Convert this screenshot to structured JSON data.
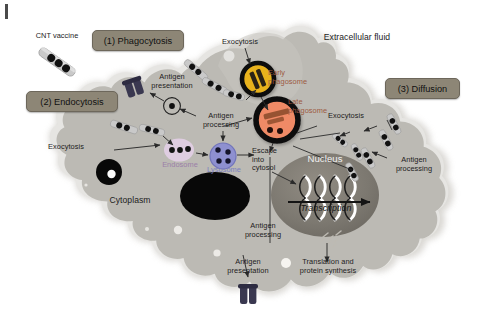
{
  "figure": {
    "domain_kind": "biology-schematic",
    "background_color": "#ffffff",
    "edge_tick_color": "#4a4a4a",
    "extracellular_label": "Extracellular fluid"
  },
  "callout_boxes": [
    {
      "id": "phagocytosis",
      "label": "(1) Phagocytosis",
      "x": 92,
      "y": 30,
      "w": 92,
      "h": 21
    },
    {
      "id": "endocytosis",
      "label": "(2) Endocytosis",
      "x": 26,
      "y": 91,
      "w": 92,
      "h": 21
    },
    {
      "id": "diffusion",
      "label": "(3) Diffusion",
      "x": 385,
      "y": 78,
      "w": 75,
      "h": 21
    }
  ],
  "labels": {
    "cnt_vaccine": "CNT vaccine",
    "extracellular_fluid": "Extracellular fluid",
    "cytoplasm": "Cytoplasm",
    "nucleus": "Nucleus",
    "transcription": "Transcription",
    "early_phagosome": "Early\nphagosome",
    "late_phagosome": "Late\nphagosome",
    "endosome": "Endosome",
    "lysosome": "Lysosome",
    "exocytosis_top": "Exocytosis",
    "exocytosis_left": "Exocytosis",
    "exocytosis_right": "Exocytosis",
    "antigen_presentation_top": "Antigen\npresentation",
    "antigen_presentation_bottom": "Antigen\npresentation",
    "antigen_processing_upper": "Antigen\nprocessing",
    "antigen_processing_right": "Antigen\nprocessing",
    "antigen_processing_bottom": "Antigen\nprocessing",
    "escape_into_cytosol": "Escape\ninto\ncytosol",
    "translation": "Translation and\nprotein synthesis"
  },
  "colors": {
    "cell_body": "#bcbab4",
    "cell_halo": "#d2d0cb",
    "cell_outline": "#e8e7e4",
    "nucleus_fill": "#7b776f",
    "early_phagosome": "#e8b21f",
    "early_phagosome_ring": "#0d0d0d",
    "late_phagosome": "#ef8a66",
    "late_phagosome_ring": "#0d0d0d",
    "endosome": "#e2cfe6",
    "lysosome": "#8e90d0",
    "vacuole_black": "#080808",
    "mhc_receptor": "#3a3850",
    "cnt_tube": "#c9c9c9",
    "cnt_dot": "#111111",
    "callout_box": "#8d8676",
    "callout_border": "#6d675b",
    "arrow": "#2a2a2a",
    "text": "#1c1c1c",
    "endosome_text": "#9b7fa8",
    "lysosome_text": "#7b7fc0",
    "late_phagosome_text": "#9c5a42"
  },
  "organelles": [
    {
      "name": "early-phagosome",
      "cx": 258,
      "cy": 79,
      "r": 16,
      "fill": "#e8b21f",
      "ring": "#0d0d0d",
      "ring_w": 4.5
    },
    {
      "name": "late-phagosome",
      "cx": 277,
      "cy": 120,
      "r": 21,
      "fill": "#ef8a66",
      "ring": "#0d0d0d",
      "ring_w": 5.5
    },
    {
      "name": "endosome",
      "cx": 179,
      "cy": 150,
      "rx": 14,
      "ry": 11,
      "fill": "#e2cfe6"
    },
    {
      "name": "lysosome",
      "cx": 223,
      "cy": 156,
      "r": 13,
      "fill": "#8e90d0",
      "ring": "#6e70b2"
    },
    {
      "name": "nucleus",
      "cx": 325,
      "cy": 195,
      "rx": 54,
      "ry": 42,
      "fill": "#7b776f"
    },
    {
      "name": "large-vacuole",
      "cx": 215,
      "cy": 196,
      "rx": 35,
      "ry": 24,
      "fill": "#080808"
    },
    {
      "name": "small-vacuole",
      "cx": 109,
      "cy": 172,
      "r": 13,
      "fill": "#080808"
    }
  ],
  "processes": [
    "Phagocytosis of CNT vaccine into early phagosome",
    "Maturation to late phagosome",
    "Escape into cytosol",
    "Endocytosis into endosome then lysosome",
    "Antigen processing and presentation via MHC",
    "Exocytosis back into extracellular fluid",
    "Passive diffusion across membrane",
    "Nuclear transcription, translation and protein synthesis"
  ]
}
